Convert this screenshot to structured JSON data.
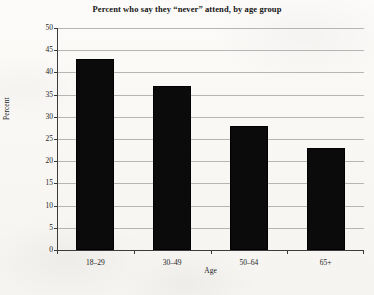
{
  "chart_data": {
    "type": "bar",
    "title": "Percent who say they “never” attend, by age group",
    "xlabel": "Age",
    "ylabel": "Percent",
    "categories": [
      "18–29",
      "30–49",
      "50–64",
      "65+"
    ],
    "values": [
      43,
      37,
      28,
      23
    ],
    "ylim": [
      0,
      50
    ],
    "ytick_labels": [
      "0",
      "5",
      "10",
      "15",
      "20",
      "25",
      "30",
      "35",
      "40",
      "45",
      "50"
    ],
    "ytick_values": [
      0,
      5,
      10,
      15,
      20,
      25,
      30,
      35,
      40,
      45,
      50
    ],
    "grid": true,
    "legend": false,
    "bar_color": "#0b0b0b",
    "background_color": "#fbfaf8",
    "gridline_color": "#8d8d8d",
    "axis_color": "#3c3c3c"
  }
}
